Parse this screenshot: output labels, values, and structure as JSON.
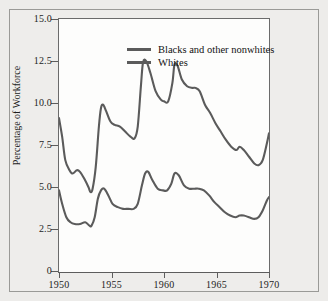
{
  "chart_data": {
    "type": "line",
    "title": "",
    "subtitle": "",
    "xlabel": "",
    "ylabel": "Percentage of Workforce",
    "xlim": [
      1950,
      1970
    ],
    "ylim": [
      0,
      15
    ],
    "grid": false,
    "legend_position": "top-left",
    "x_ticks": [
      "1950",
      "1955",
      "1960",
      "1965",
      "1970"
    ],
    "x_tick_values": [
      1950,
      1955,
      1960,
      1965,
      1970
    ],
    "y_ticks": [
      "0",
      "2.5",
      "5.0",
      "7.5",
      "10.0",
      "12.5",
      "15.0"
    ],
    "y_tick_values": [
      0,
      2.5,
      5,
      7.5,
      10,
      12.5,
      15
    ],
    "line_color": "#5b5b5b",
    "series": [
      {
        "name": "Blacks and other nonwhites",
        "x": [
          1950.0,
          1950.3,
          1950.6,
          1951.0,
          1951.3,
          1951.7,
          1952.0,
          1952.4,
          1952.8,
          1953.0,
          1953.2,
          1953.5,
          1953.8,
          1954.0,
          1954.2,
          1954.5,
          1954.9,
          1955.3,
          1955.8,
          1956.3,
          1956.8,
          1957.2,
          1957.5,
          1957.8,
          1958.0,
          1958.3,
          1958.7,
          1959.2,
          1959.7,
          1960.0,
          1960.4,
          1960.8,
          1961.0,
          1961.3,
          1961.7,
          1962.2,
          1962.7,
          1963.0,
          1963.4,
          1963.9,
          1964.4,
          1964.9,
          1965.4,
          1965.9,
          1966.4,
          1966.9,
          1967.2,
          1967.6,
          1968.1,
          1968.6,
          1969.0,
          1969.4,
          1969.8,
          1970.0
        ],
        "y": [
          9.1,
          8.0,
          6.6,
          6.0,
          5.8,
          6.0,
          5.9,
          5.5,
          5.0,
          4.7,
          4.9,
          6.2,
          8.6,
          9.7,
          9.9,
          9.5,
          8.9,
          8.7,
          8.6,
          8.3,
          8.0,
          7.9,
          8.6,
          11.0,
          12.4,
          12.5,
          11.8,
          10.7,
          10.2,
          10.1,
          10.1,
          11.2,
          12.3,
          12.2,
          11.4,
          11.0,
          10.9,
          10.9,
          10.7,
          9.9,
          9.4,
          8.8,
          8.3,
          7.8,
          7.4,
          7.2,
          7.4,
          7.2,
          6.8,
          6.4,
          6.3,
          6.6,
          7.6,
          8.2
        ]
      },
      {
        "name": "Whites",
        "x": [
          1950.0,
          1950.3,
          1950.7,
          1951.1,
          1951.5,
          1952.0,
          1952.5,
          1952.9,
          1953.1,
          1953.4,
          1953.7,
          1954.0,
          1954.3,
          1954.7,
          1955.1,
          1955.6,
          1956.1,
          1956.6,
          1957.1,
          1957.5,
          1957.9,
          1958.2,
          1958.5,
          1958.9,
          1959.4,
          1959.9,
          1960.3,
          1960.7,
          1961.0,
          1961.4,
          1961.9,
          1962.4,
          1962.9,
          1963.3,
          1963.8,
          1964.3,
          1964.8,
          1965.3,
          1965.8,
          1966.3,
          1966.8,
          1967.2,
          1967.6,
          1968.1,
          1968.6,
          1969.0,
          1969.4,
          1969.8,
          1970.0
        ],
        "y": [
          4.8,
          4.0,
          3.2,
          2.9,
          2.8,
          2.8,
          2.9,
          2.7,
          2.7,
          3.2,
          4.3,
          4.8,
          4.9,
          4.5,
          4.0,
          3.8,
          3.7,
          3.7,
          3.7,
          4.0,
          5.1,
          5.8,
          5.9,
          5.4,
          4.9,
          4.8,
          4.8,
          5.2,
          5.8,
          5.7,
          5.1,
          4.9,
          4.9,
          4.9,
          4.8,
          4.5,
          4.1,
          3.8,
          3.5,
          3.3,
          3.2,
          3.3,
          3.3,
          3.2,
          3.1,
          3.2,
          3.6,
          4.2,
          4.4
        ]
      }
    ]
  },
  "legend": {
    "entries": [
      {
        "label": "Blacks and other nonwhites"
      },
      {
        "label": "Whites"
      }
    ]
  },
  "axes": {
    "y_title": "Percentage of Workforce"
  }
}
